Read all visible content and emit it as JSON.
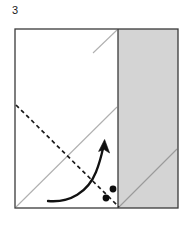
{
  "diagram": {
    "step_label": "3",
    "colors": {
      "paper_front": "#ffffff",
      "paper_back_shaded": "#d4d4d4",
      "outline": "#3a3a3a",
      "crease_existing": "#b0b0b0",
      "fold_line_dashed": "#1a1a1a",
      "arrow": "#111111",
      "background": "#ffffff"
    },
    "panels": [
      {
        "name": "left-white-panel",
        "fill": "#ffffff",
        "x": 15,
        "y": 29,
        "width": 103,
        "height": 179
      },
      {
        "name": "right-shaded-panel",
        "fill": "#d4d4d4",
        "x": 118,
        "y": 29,
        "width": 60,
        "height": 179
      }
    ],
    "lines": [
      {
        "name": "existing-crease-main-diagonal",
        "style": "solid-light",
        "color": "#b0b0b0",
        "x1": 16,
        "y1": 207,
        "x2": 117,
        "y2": 107
      },
      {
        "name": "existing-crease-top-short-diagonal",
        "style": "solid-light",
        "color": "#b0b0b0",
        "x1": 93,
        "y1": 53,
        "x2": 117,
        "y2": 30
      },
      {
        "name": "existing-crease-shaded-diagonal",
        "style": "solid-light",
        "color": "#9a9a9a",
        "x1": 119,
        "y1": 207,
        "x2": 177,
        "y2": 149
      },
      {
        "name": "valley-fold-dashed-line",
        "style": "dashed",
        "color": "#1a1a1a",
        "x1": 16,
        "y1": 105,
        "x2": 119,
        "y2": 207
      },
      {
        "name": "panel-divider-vertical",
        "style": "solid",
        "color": "#3a3a3a",
        "x1": 118,
        "y1": 29,
        "x2": 118,
        "y2": 208
      }
    ],
    "dots": [
      {
        "name": "reference-dot-upper",
        "cx": 113,
        "cy": 189,
        "r": 3.4
      },
      {
        "name": "reference-dot-lower",
        "cx": 106,
        "cy": 198,
        "r": 3.4
      }
    ],
    "arrow": {
      "name": "fold-direction-arrow",
      "type": "curved",
      "start": {
        "x": 48,
        "y": 201
      },
      "end": {
        "x": 104,
        "y": 145
      },
      "direction": "up-right",
      "color": "#111111"
    }
  }
}
